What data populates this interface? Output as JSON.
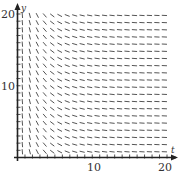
{
  "chart_data": {
    "type": "slope_field",
    "title": "",
    "xlabel": "t",
    "ylabel": "y",
    "xlim": [
      0,
      20
    ],
    "ylim": [
      0,
      20
    ],
    "x_ticks": [
      10,
      20
    ],
    "y_ticks": [
      10,
      20
    ],
    "grid": false,
    "legend": null,
    "field": {
      "x_values": [
        1,
        2,
        3,
        4,
        5,
        6,
        7,
        8,
        9,
        10,
        11,
        12,
        13,
        14,
        15,
        16,
        17,
        18,
        19,
        20
      ],
      "y_values": [
        1,
        2,
        3,
        4,
        5,
        6,
        7,
        8,
        9,
        10,
        11,
        12,
        13,
        14,
        15,
        16,
        17,
        18,
        19,
        20
      ],
      "slope_description": "Negative slopes, nearly vertical near t=0, flattening to near-horizontal for t > 8; slope independent of y",
      "approx_slope_by_x": [
        -12,
        -4,
        -2,
        -1.2,
        -0.8,
        -0.55,
        -0.4,
        -0.3,
        -0.24,
        -0.2,
        -0.16,
        -0.14,
        -0.12,
        -0.1,
        -0.09,
        -0.08,
        -0.07,
        -0.06,
        -0.055,
        -0.05
      ]
    }
  },
  "axes": {
    "x_label": "t",
    "y_label": "y",
    "x_tick_labels": [
      "10",
      "20"
    ],
    "y_tick_labels": [
      "10",
      "20"
    ]
  },
  "colors": {
    "axis": "#222222",
    "segments": "#555555",
    "text": "#333333"
  }
}
